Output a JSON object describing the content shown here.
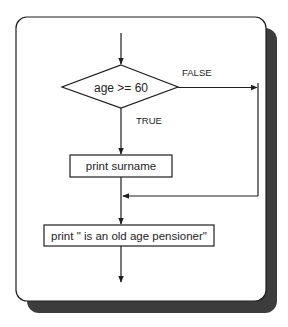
{
  "diagram": {
    "type": "flowchart",
    "decision": {
      "label": "age >= 60",
      "false_label": "FALSE",
      "true_label": "TRUE"
    },
    "processes": [
      {
        "label": "print surname"
      },
      {
        "label": "print \" is an old age pensioner\""
      }
    ],
    "colors": {
      "stroke": "#1e1e1e",
      "background": "#ffffff",
      "shadow": "#3c3c3c"
    }
  }
}
